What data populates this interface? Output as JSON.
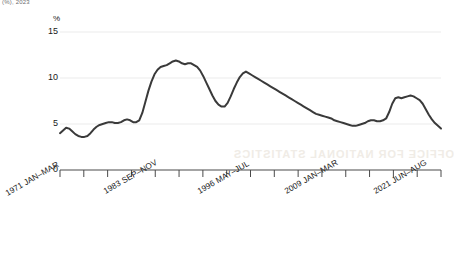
{
  "header": {
    "top_note": "(%), 2023"
  },
  "watermark": {
    "text": "OFFICE FOR NATIONAL STATISTICS"
  },
  "axis": {
    "y_unit": "%",
    "y_ticks": [
      "0",
      "5",
      "10",
      "15"
    ],
    "x_ticks": [
      "1971 JAN–MAR",
      "1983 SEP–NOV",
      "1996 MAY–JUL",
      "2009 JAN–MAR",
      "2021 JUN–AUG"
    ]
  },
  "style": {
    "line_color": "#3a3a3a",
    "grid_color": "#ebebeb",
    "axis_color": "#4a4a4a",
    "text_color": "#1a1a1a"
  },
  "chart_data": {
    "type": "line",
    "title": "",
    "subtitle": "",
    "xlabel": "",
    "ylabel": "%",
    "ylim": [
      0,
      15
    ],
    "grid": true,
    "legend": "none",
    "y_tick_values": [
      0,
      5,
      10,
      15
    ],
    "x_tick_labels": [
      "1971 JAN–MAR",
      "1983 SEP–NOV",
      "1996 MAY–JUL",
      "2009 JAN–MAR",
      "2021 JUN–AUG"
    ],
    "x_tick_positions_frac": [
      0.0,
      0.253,
      0.519,
      0.785,
      1.0
    ],
    "series": [
      {
        "name": "Unemployment rate",
        "x": [
          0.0,
          0.008,
          0.016,
          0.024,
          0.032,
          0.04,
          0.048,
          0.056,
          0.064,
          0.072,
          0.08,
          0.088,
          0.096,
          0.104,
          0.112,
          0.12,
          0.128,
          0.136,
          0.144,
          0.152,
          0.16,
          0.168,
          0.176,
          0.184,
          0.192,
          0.2,
          0.208,
          0.216,
          0.224,
          0.232,
          0.24,
          0.248,
          0.256,
          0.264,
          0.272,
          0.28,
          0.288,
          0.296,
          0.304,
          0.312,
          0.32,
          0.328,
          0.336,
          0.344,
          0.352,
          0.36,
          0.368,
          0.376,
          0.384,
          0.392,
          0.4,
          0.408,
          0.416,
          0.424,
          0.432,
          0.44,
          0.448,
          0.456,
          0.464,
          0.472,
          0.48,
          0.488,
          0.496,
          0.504,
          0.512,
          0.52,
          0.528,
          0.536,
          0.544,
          0.552,
          0.56,
          0.568,
          0.576,
          0.584,
          0.592,
          0.6,
          0.608,
          0.616,
          0.624,
          0.632,
          0.64,
          0.648,
          0.656,
          0.664,
          0.672,
          0.68,
          0.688,
          0.696,
          0.704,
          0.712,
          0.72,
          0.728,
          0.736,
          0.744,
          0.752,
          0.76,
          0.768,
          0.776,
          0.784,
          0.792,
          0.8,
          0.808,
          0.816,
          0.824,
          0.832,
          0.84,
          0.848,
          0.856,
          0.864,
          0.872,
          0.88,
          0.888,
          0.896,
          0.904,
          0.912,
          0.92,
          0.928,
          0.936,
          0.944,
          0.952,
          0.96,
          0.968,
          0.976,
          0.984,
          0.992,
          1.0
        ],
        "y": [
          4.0,
          4.3,
          4.6,
          4.5,
          4.2,
          3.9,
          3.7,
          3.6,
          3.6,
          3.7,
          4.0,
          4.4,
          4.7,
          4.9,
          5.0,
          5.1,
          5.2,
          5.2,
          5.1,
          5.1,
          5.2,
          5.4,
          5.5,
          5.4,
          5.2,
          5.2,
          5.4,
          6.2,
          7.4,
          8.6,
          9.6,
          10.4,
          10.9,
          11.2,
          11.3,
          11.4,
          11.6,
          11.8,
          11.9,
          11.8,
          11.6,
          11.5,
          11.6,
          11.6,
          11.4,
          11.2,
          10.8,
          10.2,
          9.5,
          8.8,
          8.1,
          7.5,
          7.1,
          6.9,
          6.9,
          7.3,
          8.0,
          8.8,
          9.5,
          10.1,
          10.5,
          10.7,
          10.5,
          10.3,
          10.1,
          9.9,
          9.7,
          9.5,
          9.3,
          9.1,
          8.9,
          8.7,
          8.5,
          8.3,
          8.1,
          7.9,
          7.7,
          7.5,
          7.3,
          7.1,
          6.9,
          6.7,
          6.5,
          6.3,
          6.1,
          6.0,
          5.9,
          5.8,
          5.7,
          5.6,
          5.4,
          5.3,
          5.2,
          5.1,
          5.0,
          4.9,
          4.8,
          4.8,
          4.9,
          5.0,
          5.1,
          5.3,
          5.4,
          5.4,
          5.3,
          5.3,
          5.4,
          5.6,
          6.3,
          7.2,
          7.8,
          7.9,
          7.8,
          7.9,
          8.0,
          8.1,
          8.0,
          7.8,
          7.6,
          7.2,
          6.6,
          6.0,
          5.5,
          5.1,
          4.8,
          4.5
        ]
      }
    ],
    "annotations": [
      {
        "label": "peak",
        "x": 0.304,
        "y": 11.9
      },
      {
        "label": "second peak",
        "x": 0.488,
        "y": 10.7
      },
      {
        "label": "trough",
        "x": 0.776,
        "y": 4.8
      }
    ]
  }
}
